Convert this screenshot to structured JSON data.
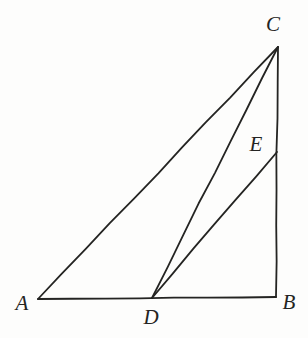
{
  "figure": {
    "kind": "geometry-diagram",
    "canvas": {
      "width": 308,
      "height": 338,
      "background": "#fdfdfc"
    },
    "stroke": {
      "color": "#242422",
      "width": 1.8
    },
    "points": [
      {
        "id": "A",
        "label": "A",
        "x": 38,
        "y": 299,
        "label_x": 22,
        "label_y": 303
      },
      {
        "id": "B",
        "label": "B",
        "x": 276,
        "y": 297,
        "label_x": 289,
        "label_y": 302
      },
      {
        "id": "C",
        "label": "C",
        "x": 278,
        "y": 47,
        "label_x": 273,
        "label_y": 24
      },
      {
        "id": "D",
        "label": "D",
        "x": 152,
        "y": 298,
        "label_x": 151,
        "label_y": 317
      },
      {
        "id": "E",
        "label": "E",
        "x": 277,
        "y": 152,
        "label_x": 256,
        "label_y": 144
      }
    ],
    "segments": [
      {
        "id": "AB",
        "from": "A",
        "to": "B",
        "name": "segment-ab"
      },
      {
        "id": "AC",
        "from": "A",
        "to": "C",
        "name": "segment-ac"
      },
      {
        "id": "CB",
        "from": "C",
        "to": "B",
        "name": "segment-cb"
      },
      {
        "id": "DC",
        "from": "D",
        "to": "C",
        "name": "segment-dc"
      },
      {
        "id": "DE",
        "from": "D",
        "to": "E",
        "name": "segment-de"
      }
    ]
  },
  "chart_data": {
    "type": "diagram",
    "xlabel": "",
    "ylabel": "",
    "grid": false,
    "legend": "none",
    "xlim": [
      0,
      308
    ],
    "ylim": [
      338,
      0
    ],
    "points": {
      "A": [
        38,
        299
      ],
      "B": [
        276,
        297
      ],
      "C": [
        278,
        47
      ],
      "D": [
        152,
        298
      ],
      "E": [
        277,
        152
      ]
    },
    "edges": [
      [
        "A",
        "B"
      ],
      [
        "A",
        "C"
      ],
      [
        "C",
        "B"
      ],
      [
        "D",
        "C"
      ],
      [
        "D",
        "E"
      ]
    ],
    "annotations": [
      "A",
      "B",
      "C",
      "D",
      "E"
    ]
  }
}
